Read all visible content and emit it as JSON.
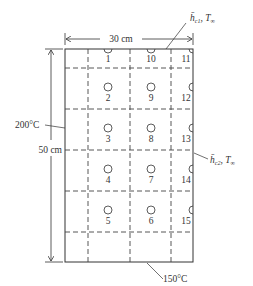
{
  "diagram": {
    "width_label": "30 cm",
    "height_label": "50 cm",
    "left_temp_label": "200°C",
    "bottom_temp_label": "150°C",
    "top_convection_label": {
      "h": "h̄",
      "sub": "c1",
      "T": "T",
      "Tsub": "∞"
    },
    "right_convection_label": {
      "h": "h̄",
      "sub": "c2",
      "T": "T",
      "Tsub": "∞"
    },
    "nodes": [
      {
        "id": "1",
        "x": 108,
        "y": 49,
        "kind": "half-top"
      },
      {
        "id": "10",
        "x": 151,
        "y": 49,
        "kind": "half-top"
      },
      {
        "id": "11",
        "x": 193,
        "y": 49,
        "kind": "corner"
      },
      {
        "id": "2",
        "x": 108,
        "y": 88,
        "kind": "full"
      },
      {
        "id": "9",
        "x": 151,
        "y": 88,
        "kind": "full"
      },
      {
        "id": "12",
        "x": 193,
        "y": 88,
        "kind": "half-right"
      },
      {
        "id": "3",
        "x": 108,
        "y": 129,
        "kind": "full"
      },
      {
        "id": "8",
        "x": 151,
        "y": 129,
        "kind": "full"
      },
      {
        "id": "13",
        "x": 193,
        "y": 129,
        "kind": "half-right"
      },
      {
        "id": "4",
        "x": 108,
        "y": 170,
        "kind": "full"
      },
      {
        "id": "7",
        "x": 151,
        "y": 170,
        "kind": "full"
      },
      {
        "id": "14",
        "x": 193,
        "y": 170,
        "kind": "half-right"
      },
      {
        "id": "5",
        "x": 108,
        "y": 211,
        "kind": "full"
      },
      {
        "id": "6",
        "x": 151,
        "y": 211,
        "kind": "full"
      },
      {
        "id": "15",
        "x": 193,
        "y": 211,
        "kind": "half-right"
      }
    ]
  }
}
